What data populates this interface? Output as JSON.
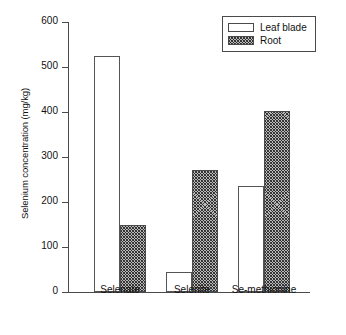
{
  "chart_data": {
    "type": "bar",
    "title": "",
    "xlabel": "",
    "ylabel": "Selenium concentration (mg/kg)",
    "categories": [
      "Selenate",
      "Selenite",
      "Se-methionine"
    ],
    "series": [
      {
        "name": "Leaf blade",
        "values": [
          524,
          44,
          236
        ],
        "fill": "white",
        "pattern": "solid"
      },
      {
        "name": "Root",
        "values": [
          149,
          271,
          402
        ],
        "fill": "#b9b9b9",
        "pattern": "hatched"
      }
    ],
    "ylim": [
      0,
      600
    ],
    "yticks": [
      0,
      100,
      200,
      300,
      400,
      500,
      600
    ],
    "ytick_labels": [
      "0",
      "100",
      "200",
      "300",
      "400",
      "500",
      "600"
    ],
    "grid": false,
    "legend_position": "top-right",
    "legend_entries": [
      "Leaf blade",
      "Root"
    ],
    "axis_color": "#4a4a4a"
  }
}
